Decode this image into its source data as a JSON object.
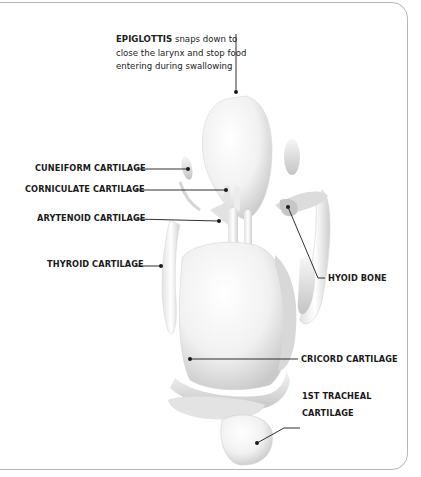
{
  "diagram": {
    "callout": {
      "title": "EPIGLOTTIS",
      "line1_rest": " snaps down to",
      "line2": "close the larynx and stop food",
      "line3": "entering during swallowing"
    },
    "labels": {
      "cuneiform": "CUNEIFORM CARTILAGE",
      "corniculate": "CORNICULATE CARTILAGE",
      "arytenoid": "ARYTENOID CARTILAGE",
      "thyroid": "THYROID CARTILAGE",
      "hyoid": "HYOID BONE",
      "cricoid": "CRICORD CARTILAGE",
      "tracheal_line1": "1ST TRACHEAL",
      "tracheal_line2": "CARTILAGE"
    },
    "colors": {
      "leader_line": "#1a1a1a",
      "frame_border": "#b5b5b5",
      "model_light": "#ffffff",
      "model_shadow": "#c8c8c8"
    }
  }
}
